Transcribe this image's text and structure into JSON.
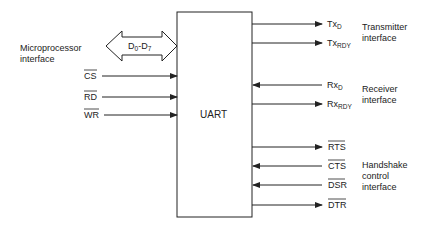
{
  "diagram": {
    "block": {
      "label": "UART"
    },
    "bus": {
      "label_main": "D",
      "sub_start": "0",
      "dash": "-",
      "label_end": "D",
      "sub_end": "7",
      "direction": "bidirectional"
    },
    "groups": {
      "microprocessor": {
        "line1": "Microprocessor",
        "line2": "interface"
      },
      "transmitter": {
        "line1": "Transmitter",
        "line2": "interface"
      },
      "receiver": {
        "line1": "Receiver",
        "line2": "interface"
      },
      "handshake": {
        "line1": "Handshake",
        "line2": "control",
        "line3": "interface"
      }
    },
    "left_signals": [
      {
        "name": "CS",
        "active_low": true,
        "direction": "in"
      },
      {
        "name": "RD",
        "active_low": true,
        "direction": "in"
      },
      {
        "name": "WR",
        "active_low": true,
        "direction": "in"
      }
    ],
    "right_signals": [
      {
        "base": "Tx",
        "sub": "D",
        "direction": "out"
      },
      {
        "base": "Tx",
        "sub": "RDY",
        "direction": "out"
      },
      {
        "base": "Rx",
        "sub": "D",
        "direction": "in"
      },
      {
        "base": "Rx",
        "sub": "RDY",
        "direction": "out"
      },
      {
        "base": "RTS",
        "sub": "",
        "active_low": true,
        "direction": "out"
      },
      {
        "base": "CTS",
        "sub": "",
        "active_low": true,
        "direction": "in"
      },
      {
        "base": "DSR",
        "sub": "",
        "active_low": true,
        "direction": "in"
      },
      {
        "base": "DTR",
        "sub": "",
        "active_low": true,
        "direction": "out"
      }
    ],
    "colors": {
      "line": "#222222",
      "background": "#ffffff"
    }
  }
}
